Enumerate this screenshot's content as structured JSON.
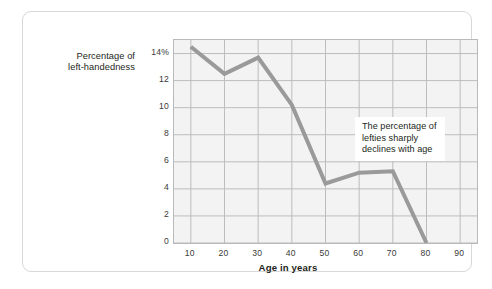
{
  "chart_data": {
    "type": "line",
    "title": "",
    "xlabel": "Age in years",
    "ylabel": "Percentage of left-handedness",
    "ylabel_lines": [
      "Percentage of",
      "left-handedness"
    ],
    "x": [
      10,
      20,
      30,
      40,
      50,
      60,
      70,
      80
    ],
    "values": [
      14.5,
      12.5,
      13.7,
      10.2,
      4.4,
      5.2,
      5.3,
      0
    ],
    "series": [
      {
        "name": "Percentage of left-handedness",
        "values": [
          14.5,
          12.5,
          13.7,
          10.2,
          4.4,
          5.2,
          5.3,
          0
        ]
      }
    ],
    "xlim": [
      5,
      95
    ],
    "ylim": [
      0,
      15
    ],
    "xticks": [
      10,
      20,
      30,
      40,
      50,
      60,
      70,
      80,
      90
    ],
    "xtick_labels": [
      "10",
      "20",
      "30",
      "40",
      "50",
      "60",
      "70",
      "80",
      "90"
    ],
    "yticks": [
      0,
      2,
      4,
      6,
      8,
      10,
      12,
      14
    ],
    "ytick_labels": [
      "0",
      "2",
      "4",
      "6",
      "8",
      "10",
      "12",
      "14%"
    ],
    "grid": true,
    "legend": "none",
    "annotations": [
      {
        "text": "The percentage of lefties sharply declines with age",
        "lines": [
          "The percentage of",
          "lefties sharply",
          "declines with age"
        ]
      }
    ],
    "colors": {
      "line": "#9a9a9a",
      "plot_background": "#f3f3f3",
      "gridline": "#bdbdbd",
      "plot_border": "#b9b9b9",
      "text": "#231f20",
      "tick_text": "#3a3a3a",
      "card_border": "#d8d8d8",
      "page_background": "#ffffff"
    },
    "line_width": 4
  }
}
